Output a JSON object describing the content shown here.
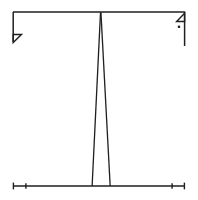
{
  "figure": {
    "title": "",
    "background_color": "#ffffff",
    "stroke_color": "#1f1f1f",
    "width": 198,
    "height": 200
  },
  "chart_data": {
    "type": "line",
    "title": "",
    "xlabel": "",
    "ylabel": "",
    "grid": false,
    "legend": null,
    "xlim": [
      0,
      1
    ],
    "ylim": [
      0,
      1
    ],
    "series": [
      {
        "name": "narrow-peak",
        "x": [
          0.46,
          0.51,
          0.565
        ],
        "values": [
          0.0,
          1.0,
          0.0
        ]
      }
    ],
    "annotations": [
      {
        "name": "top-reference-line",
        "kind": "horizontal-line",
        "y": 1.0,
        "x_from": 0.0,
        "x_to": 1.0
      },
      {
        "name": "baseline-axis",
        "kind": "horizontal-line",
        "y": 0.0,
        "x_from": 0.0,
        "x_to": 1.0
      },
      {
        "name": "left-drop-segment",
        "kind": "vertical-segment",
        "x": 0.0,
        "y_from": 1.0,
        "y_to": 0.83
      },
      {
        "name": "right-drop-segment",
        "kind": "vertical-segment",
        "x": 1.0,
        "y_from": 1.0,
        "y_to": 0.8
      },
      {
        "name": "left-arrow-marker",
        "kind": "arrowhead",
        "direction": "down-left",
        "x": 0.0,
        "y": 0.83
      },
      {
        "name": "right-arrow-marker",
        "kind": "arrowhead",
        "direction": "up-right",
        "x": 1.0,
        "y": 1.0
      },
      {
        "name": "marker-dot",
        "kind": "point",
        "x": 0.965,
        "y": 0.915
      },
      {
        "name": "axis-tick-left",
        "kind": "tick",
        "x": 0.0
      },
      {
        "name": "axis-tick-left-inner",
        "kind": "tick",
        "x": 0.075
      },
      {
        "name": "axis-tick-right-inner",
        "kind": "tick",
        "x": 0.925
      },
      {
        "name": "axis-tick-right",
        "kind": "tick",
        "x": 1.0
      }
    ],
    "peak": {
      "position": 0.51,
      "height": 1.0,
      "base_left": 0.46,
      "base_right": 0.565,
      "base_width": 0.105
    }
  }
}
